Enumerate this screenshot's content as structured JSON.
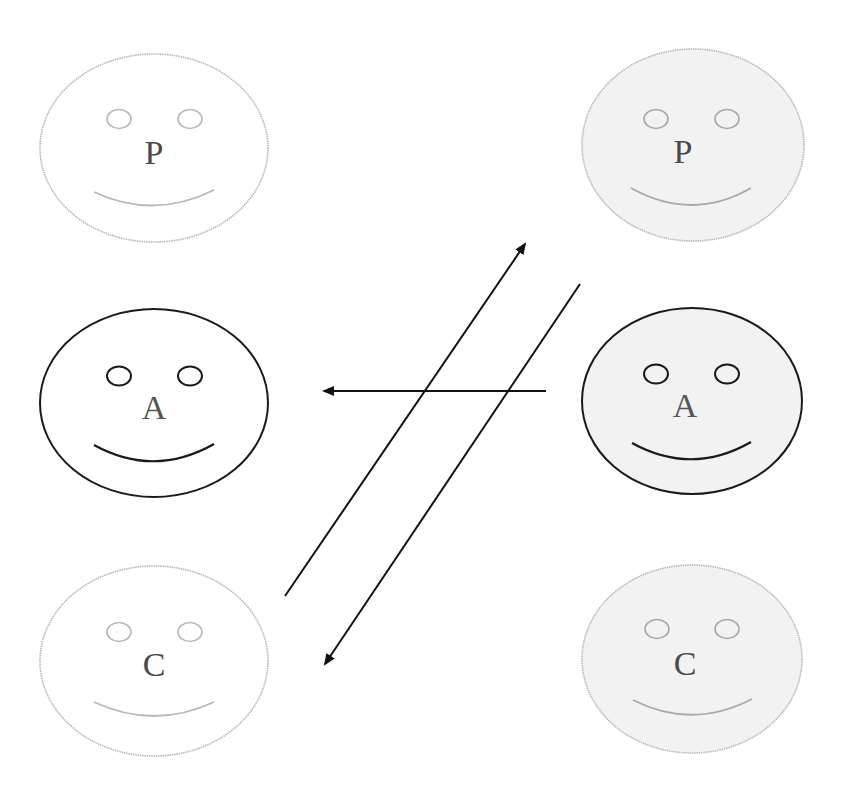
{
  "diagram": {
    "left_person": {
      "states": [
        {
          "id": "P",
          "label": "P",
          "highlighted": false
        },
        {
          "id": "A",
          "label": "A",
          "highlighted": true
        },
        {
          "id": "C",
          "label": "C",
          "highlighted": false
        }
      ],
      "fill": "#ffffff"
    },
    "right_person": {
      "states": [
        {
          "id": "P",
          "label": "P",
          "highlighted": false
        },
        {
          "id": "A",
          "label": "A",
          "highlighted": true
        },
        {
          "id": "C",
          "label": "C",
          "highlighted": false
        }
      ],
      "fill": "#f2f2f2"
    },
    "arrows": [
      {
        "from": "right.A",
        "to": "left.A",
        "direction": "left"
      },
      {
        "from": "left.C",
        "to": "right.P",
        "direction": "up-right"
      },
      {
        "from": "right.P",
        "to": "left.C",
        "direction": "down-left"
      }
    ],
    "colors": {
      "highlight_stroke": "#1a1a1a",
      "faded_stroke": "#b5b5b5",
      "faded_text": "#4a4a4a",
      "arrow": "#111111"
    }
  }
}
